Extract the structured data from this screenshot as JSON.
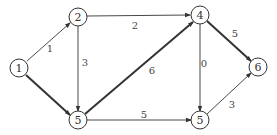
{
  "diagram": {
    "type": "weighted-directed-graph",
    "nodes": [
      {
        "id": "n1",
        "label": "1",
        "x": 19,
        "y": 68
      },
      {
        "id": "n2",
        "label": "2",
        "x": 78,
        "y": 17
      },
      {
        "id": "n5a",
        "label": "5",
        "x": 78,
        "y": 120
      },
      {
        "id": "n4",
        "label": "4",
        "x": 200,
        "y": 15
      },
      {
        "id": "n5b",
        "label": "5",
        "x": 200,
        "y": 120
      },
      {
        "id": "n6",
        "label": "6",
        "x": 258,
        "y": 67
      }
    ],
    "edges": [
      {
        "from": "n1",
        "to": "n2",
        "weight": "1",
        "thick": false
      },
      {
        "from": "n1",
        "to": "n5a",
        "weight": "",
        "thick": true
      },
      {
        "from": "n2",
        "to": "n4",
        "weight": "2",
        "thick": false
      },
      {
        "from": "n2",
        "to": "n5a",
        "weight": "3",
        "thick": false
      },
      {
        "from": "n5a",
        "to": "n4",
        "weight": "6",
        "thick": true
      },
      {
        "from": "n5a",
        "to": "n5b",
        "weight": "5",
        "thick": false
      },
      {
        "from": "n4",
        "to": "n5b",
        "weight": "0",
        "thick": false
      },
      {
        "from": "n4",
        "to": "n6",
        "weight": "5",
        "thick": true
      },
      {
        "from": "n5b",
        "to": "n6",
        "weight": "3",
        "thick": false
      }
    ],
    "labels": {
      "n1": "1",
      "n2": "2",
      "n5a": "5",
      "n4": "4",
      "n5b": "5",
      "n6": "6",
      "w_1_2": "1",
      "w_2_4": "2",
      "w_2_5": "3",
      "w_5_4": "6",
      "w_5_5": "5",
      "w_4_5": "0",
      "w_4_6": "5",
      "w_5_6": "3"
    }
  }
}
